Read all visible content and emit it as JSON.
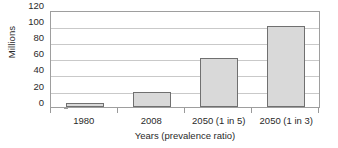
{
  "chart_data": {
    "type": "bar",
    "title": "",
    "xlabel": "Years (prevalence ratio)",
    "ylabel": "Millions",
    "categories": [
      "1980",
      "2008",
      "2050 (1 in 5)",
      "2050 (1 in 3)"
    ],
    "values": [
      5,
      19,
      62,
      102
    ],
    "series": [
      {
        "name": "Millions",
        "values": [
          5,
          19,
          62,
          102
        ]
      }
    ],
    "ylim": [
      0,
      120
    ],
    "yticks": [
      0,
      20,
      40,
      60,
      80,
      100,
      120
    ],
    "ytick_labels": [
      "0",
      "20",
      "40",
      "60",
      "80",
      "100",
      "120"
    ],
    "grid": "horizontal",
    "legend": "none",
    "colors": {
      "bar_fill": "#d9d9d9",
      "bar_border": "#707070",
      "gridline": "#c9c9c9",
      "axis": "#9e9e9e",
      "text": "#2a2a2a",
      "background": "#ffffff"
    }
  }
}
